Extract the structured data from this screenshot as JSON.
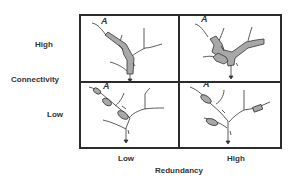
{
  "y_axis": {
    "title": "Connectivity",
    "high_label": "High",
    "low_label": "Low"
  },
  "x_axis": {
    "title": "Redundancy",
    "low_label": "Low",
    "high_label": "High"
  },
  "panels": [
    {
      "id": "high-connectivity-low-redundancy",
      "marker": "A"
    },
    {
      "id": "high-connectivity-high-redundancy",
      "marker": "A"
    },
    {
      "id": "low-connectivity-low-redundancy",
      "marker": "A"
    },
    {
      "id": "low-connectivity-high-redundancy",
      "marker": "A"
    }
  ],
  "colors": {
    "frame": "#2b2b2b",
    "channel_fill": "#a8a8a8",
    "line": "#333333"
  }
}
